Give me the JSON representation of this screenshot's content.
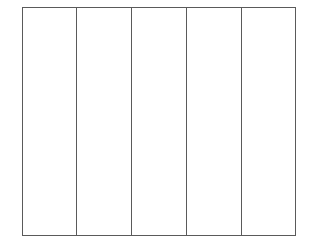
{
  "figure": {
    "type": "table-grid",
    "title": "",
    "caption": "",
    "background_color": "#ffffff",
    "canvas": {
      "width": 312,
      "height": 249
    }
  },
  "frame": {
    "name": "outer-border",
    "left": 22,
    "top": 7,
    "width": 274,
    "height": 229,
    "border_color": "#5a5a5a",
    "border_width": 1.5
  },
  "grid": {
    "columns": 5,
    "rows": 1,
    "divider_color": "#5a5a5a",
    "divider_width": 1.5,
    "divider_positions": [
      77,
      132,
      187,
      242
    ],
    "column_width": 54.8,
    "has_horizontal_dividers": false,
    "has_header_row": false,
    "fill_color": "#ffffff"
  },
  "columns": [
    {
      "index": 1,
      "label": "",
      "fill": "#ffffff"
    },
    {
      "index": 2,
      "label": "",
      "fill": "#ffffff"
    },
    {
      "index": 3,
      "label": "",
      "fill": "#ffffff"
    },
    {
      "index": 4,
      "label": "",
      "fill": "#ffffff"
    },
    {
      "index": 5,
      "label": "",
      "fill": "#ffffff"
    }
  ]
}
